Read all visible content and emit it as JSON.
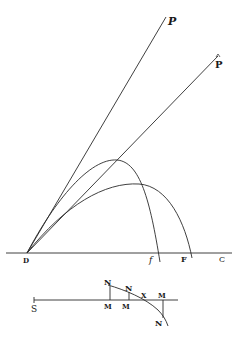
{
  "figure": {
    "ink_color": "#2a2a2a",
    "upper_diagram": {
      "labels": {
        "P_upper": "P",
        "P_lower": "P",
        "D": "D",
        "f": "f",
        "F": "F",
        "C": "C"
      }
    },
    "lower_diagram": {
      "labels": {
        "S": "S",
        "N1": "N",
        "N2": "N",
        "N3": "N",
        "M1": "M",
        "M2": "M",
        "M3": "M",
        "X": "X"
      }
    }
  }
}
